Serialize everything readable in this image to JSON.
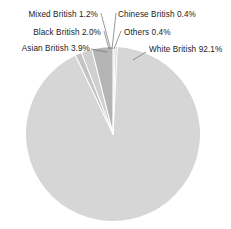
{
  "chart_data": {
    "type": "pie",
    "title": "",
    "subtitle": "",
    "xlabel": "",
    "ylabel": "",
    "legend_position": "none",
    "grid": false,
    "unit": "%",
    "categories": [
      "White British",
      "Asian British",
      "Black British",
      "Mixed British",
      "Chinese British",
      "Others"
    ],
    "values": [
      92.1,
      3.9,
      2.0,
      1.2,
      0.4,
      0.4
    ],
    "slices": [
      {
        "label": "White British",
        "value": 92.1,
        "value_text": "92.1%",
        "label_text": "White British 92.1%",
        "color": "#d6d6d6"
      },
      {
        "label": "Asian British",
        "value": 3.9,
        "value_text": "3.9%",
        "label_text": "Asian British 3.9%",
        "color": "#b4b4b4"
      },
      {
        "label": "Black British",
        "value": 2.0,
        "value_text": "2.0%",
        "label_text": "Black British 2.0%",
        "color": "#cfcfcf"
      },
      {
        "label": "Mixed British",
        "value": 1.2,
        "value_text": "1.2%",
        "label_text": "Mixed British 1.2%",
        "color": "#c4c4c4"
      },
      {
        "label": "Chinese British",
        "value": 0.4,
        "value_text": "0.4%",
        "label_text": "Chinese British 0.4%",
        "color": "#e2e2e2"
      },
      {
        "label": "Others",
        "value": 0.4,
        "value_text": "0.4%",
        "label_text": "Others 0.4%",
        "color": "#cccccc"
      }
    ]
  },
  "labels": {
    "mixed_british": "Mixed British 1.2%",
    "black_british": "Black British 2.0%",
    "asian_british": "Asian British 3.9%",
    "chinese_british": "Chinese British 0.4%",
    "others": "Others 0.4%",
    "white_british": "White British 92.1%"
  },
  "colors": {
    "background": "#ffffff",
    "text": "#1a1a1a",
    "leader_line": "#6f6f6f",
    "slice_separator": "#ffffff",
    "white_british": "#d6d6d6",
    "asian_british": "#b4b4b4",
    "black_british": "#cfcfcf",
    "mixed_british": "#c4c4c4",
    "chinese_british": "#e2e2e2",
    "others": "#cccccc"
  }
}
